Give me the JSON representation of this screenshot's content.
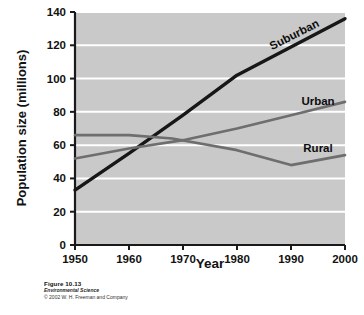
{
  "figure": {
    "caption_number": "Figure 10.13",
    "book_title": "Environmental Science",
    "copyright": "© 2002 W. H. Freeman and Company"
  },
  "colors": {
    "plot_background": "#c9c9c9",
    "gridline": "#ffffff",
    "axis": "#1a1a1a",
    "suburban_line": "#171717",
    "urban_line": "#6e6e6e",
    "rural_line": "#6e6e6e",
    "text": "#121212",
    "page_background": "#ffffff"
  },
  "chart_data": {
    "type": "line",
    "title": "",
    "xlabel": "Year",
    "ylabel": "Population size (millions)",
    "xlim": [
      1950,
      2000
    ],
    "ylim": [
      0,
      140
    ],
    "xticks": [
      1950,
      1960,
      1970,
      1980,
      1990,
      2000
    ],
    "yticks": [
      0,
      20,
      40,
      60,
      80,
      100,
      120,
      140
    ],
    "xtick_labels": [
      "1950",
      "1960",
      "1970",
      "1980",
      "1990",
      "2000"
    ],
    "ytick_labels": [
      "0",
      "20",
      "40",
      "60",
      "80",
      "100",
      "120",
      "140"
    ],
    "grid": "horizontal",
    "legend": "inline-labels",
    "series": [
      {
        "name": "Suburban",
        "color": "#171717",
        "label_position": "upper-right-along-line",
        "x": [
          1950,
          1960,
          1970,
          1980,
          1990,
          2000
        ],
        "values": [
          33,
          55,
          78,
          102,
          119,
          136
        ]
      },
      {
        "name": "Urban",
        "color": "#6e6e6e",
        "label_position": "right-above-line",
        "x": [
          1950,
          1960,
          1970,
          1980,
          1990,
          2000
        ],
        "values": [
          52,
          58,
          63,
          70,
          78,
          86
        ]
      },
      {
        "name": "Rural",
        "color": "#6e6e6e",
        "label_position": "right-above-line",
        "x": [
          1950,
          1960,
          1968,
          1980,
          1990,
          2000
        ],
        "values": [
          66,
          66,
          64,
          57,
          48,
          54
        ]
      }
    ]
  }
}
